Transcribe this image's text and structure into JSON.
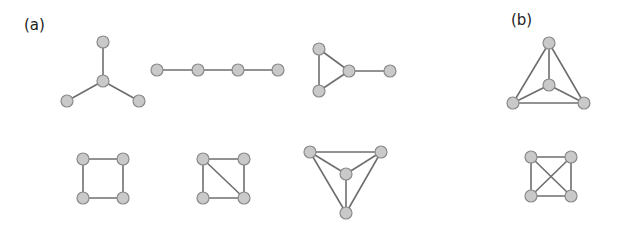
{
  "labels": {
    "a": "(a)",
    "b": "(b)"
  },
  "colors": {
    "node_fill": "#c9c9c9",
    "node_stroke": "#8a8a8a",
    "edge": "#6e6e6e"
  },
  "graphs": [
    {
      "name": "star-graph",
      "nodes": [
        [
          103,
          42
        ],
        [
          103,
          81
        ],
        [
          67,
          101
        ],
        [
          139,
          101
        ]
      ],
      "edges": [
        [
          0,
          1
        ],
        [
          1,
          2
        ],
        [
          1,
          3
        ]
      ]
    },
    {
      "name": "path-graph",
      "nodes": [
        [
          157,
          70
        ],
        [
          198,
          70
        ],
        [
          238,
          70
        ],
        [
          278,
          70
        ]
      ],
      "edges": [
        [
          0,
          1
        ],
        [
          1,
          2
        ],
        [
          2,
          3
        ]
      ]
    },
    {
      "name": "paw-graph",
      "nodes": [
        [
          319,
          49
        ],
        [
          319,
          91
        ],
        [
          349,
          71
        ],
        [
          390,
          71
        ]
      ],
      "edges": [
        [
          0,
          1
        ],
        [
          0,
          2
        ],
        [
          1,
          2
        ],
        [
          2,
          3
        ]
      ]
    },
    {
      "name": "k4-graph-b",
      "nodes": [
        [
          549,
          43
        ],
        [
          549,
          85
        ],
        [
          513,
          103
        ],
        [
          584,
          103
        ]
      ],
      "edges": [
        [
          0,
          1
        ],
        [
          0,
          2
        ],
        [
          0,
          3
        ],
        [
          1,
          2
        ],
        [
          1,
          3
        ],
        [
          2,
          3
        ]
      ]
    },
    {
      "name": "cycle-graph",
      "nodes": [
        [
          83,
          159
        ],
        [
          123,
          159
        ],
        [
          123,
          198
        ],
        [
          83,
          198
        ]
      ],
      "edges": [
        [
          0,
          1
        ],
        [
          1,
          2
        ],
        [
          2,
          3
        ],
        [
          3,
          0
        ]
      ]
    },
    {
      "name": "diamond-graph",
      "nodes": [
        [
          203,
          159
        ],
        [
          244,
          159
        ],
        [
          244,
          198
        ],
        [
          203,
          198
        ]
      ],
      "edges": [
        [
          0,
          1
        ],
        [
          1,
          2
        ],
        [
          2,
          3
        ],
        [
          3,
          0
        ],
        [
          0,
          2
        ]
      ]
    },
    {
      "name": "k4-triangle-graph",
      "nodes": [
        [
          310,
          152
        ],
        [
          381,
          152
        ],
        [
          346,
          174
        ],
        [
          346,
          213
        ]
      ],
      "edges": [
        [
          0,
          1
        ],
        [
          0,
          2
        ],
        [
          1,
          2
        ],
        [
          0,
          3
        ],
        [
          1,
          3
        ],
        [
          2,
          3
        ]
      ]
    },
    {
      "name": "k4-square-graph",
      "nodes": [
        [
          531,
          157
        ],
        [
          571,
          157
        ],
        [
          571,
          196
        ],
        [
          531,
          196
        ]
      ],
      "edges": [
        [
          0,
          1
        ],
        [
          1,
          2
        ],
        [
          2,
          3
        ],
        [
          3,
          0
        ],
        [
          0,
          2
        ],
        [
          1,
          3
        ]
      ]
    }
  ]
}
